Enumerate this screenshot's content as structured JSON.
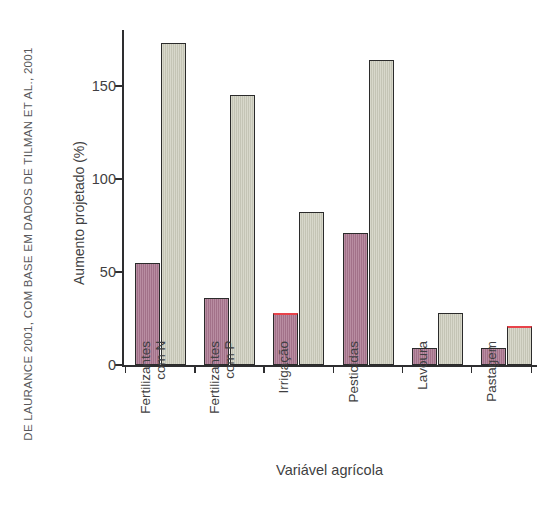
{
  "source_credit": "DE LAURANCE 2001, COM BASE EM DADOS DE TILMAN ET AL., 2001",
  "axes": {
    "y_title": "Aumento projetado (%)",
    "x_title": "Variável agrícola",
    "y_ticks": [
      "0",
      "50",
      "100",
      "150"
    ]
  },
  "chart_data": {
    "type": "bar",
    "title": "",
    "xlabel": "Variável agrícola",
    "ylabel": "Aumento projetado (%)",
    "ylim": [
      0,
      180
    ],
    "yticks": [
      0,
      50,
      100,
      150
    ],
    "grid": false,
    "legend_position": "none",
    "categories": [
      "Fertilizantes com N",
      "Fertilizantes com P",
      "Irrigação",
      "Pesticidas",
      "Lavoura",
      "Pastagem"
    ],
    "category_lines": [
      [
        "Fertilizantes",
        "com N"
      ],
      [
        "Fertilizantes",
        "com P"
      ],
      [
        "Irrigação",
        ""
      ],
      [
        "Pesticidas",
        ""
      ],
      [
        "Lavoura",
        ""
      ],
      [
        "Pastagem",
        ""
      ]
    ],
    "series": [
      {
        "name": "Atual",
        "color": "#ab7790",
        "values": [
          55,
          36,
          28,
          71,
          9,
          9
        ]
      },
      {
        "name": "Projetado",
        "color": "#cdcdbd",
        "values": [
          173,
          145,
          82,
          164,
          28,
          21
        ]
      }
    ],
    "highlight_red_top": [
      {
        "series": "Atual",
        "category_index": 2
      },
      {
        "series": "Projetado",
        "category_index": 5
      }
    ]
  },
  "colors": {
    "current_bar": "#ab7790",
    "projected_bar": "#cdcdbd",
    "bar_outline": "#2b2b2b",
    "red_highlight": "#e8424a",
    "axis": "#2e2e30",
    "text": "#3f3f42",
    "background": "#ffffff"
  }
}
